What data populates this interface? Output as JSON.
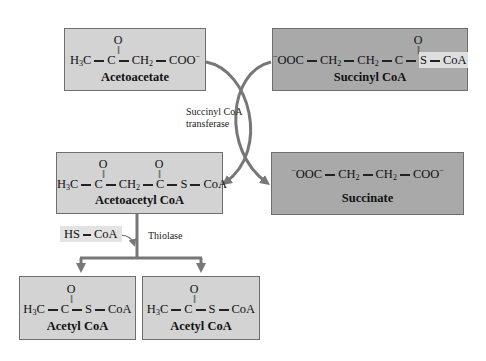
{
  "diagram": {
    "title_hint": "Conversion of acetoacetate to acetyl CoA",
    "nodes": {
      "acetoacetate": {
        "formula_parts": [
          "H",
          "3",
          "C",
          "C",
          "CH",
          "2",
          "COO",
          "−"
        ],
        "carbonyl": "O",
        "name": "Acetoacetate"
      },
      "succinyl_coa": {
        "formula_parts": [
          "−",
          "OOC",
          "CH",
          "2",
          "CH",
          "2",
          "C",
          "S",
          "CoA"
        ],
        "carbonyl": "O",
        "name": "Succinyl CoA"
      },
      "acetoacetyl_coa": {
        "formula_parts": [
          "H",
          "3",
          "C",
          "C",
          "CH",
          "2",
          "C",
          "S",
          "CoA"
        ],
        "carbonyl": "O",
        "name": "Acetoacetyl CoA"
      },
      "succinate": {
        "formula_parts": [
          "−",
          "OOC",
          "CH",
          "2",
          "CH",
          "2",
          "COO",
          "−"
        ],
        "name": "Succinate"
      },
      "acetyl_coa_1": {
        "formula_parts": [
          "H",
          "3",
          "C",
          "C",
          "S",
          "CoA"
        ],
        "carbonyl": "O",
        "name": "Acetyl CoA"
      },
      "acetyl_coa_2": {
        "formula_parts": [
          "H",
          "3",
          "C",
          "C",
          "S",
          "CoA"
        ],
        "carbonyl": "O",
        "name": "Acetyl CoA"
      }
    },
    "enzymes": {
      "transferase_line1": "Succinyl CoA",
      "transferase_line2": "transferase",
      "thiolase": "Thiolase"
    },
    "cofactor": {
      "hs": "HS",
      "coa": "CoA"
    },
    "colors": {
      "light_box": "#d3d3d3",
      "dark_box": "#a9a9a9",
      "border": "#6e6e6e",
      "arrow": "#777777"
    }
  }
}
